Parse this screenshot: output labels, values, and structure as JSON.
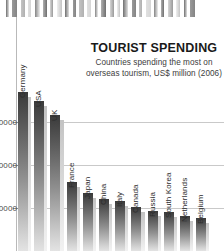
{
  "chart_data": {
    "type": "bar",
    "title": "TOURIST SPENDING",
    "subtitle_line1": "Countries spending the most on",
    "subtitle_line2": "overseas tourism, US$ million (2006)",
    "xlabel": "",
    "ylabel": "US$ million",
    "ylim": [
      0,
      80000
    ],
    "grid": true,
    "legend": "none",
    "yticks": [
      60000,
      40000,
      20000
    ],
    "ytick_labels": [
      "60000",
      "40000",
      "20000"
    ],
    "categories": [
      "Germany",
      "USA",
      "UK",
      "France",
      "Japan",
      "China",
      "Italy",
      "Canada",
      "Russia",
      "South Korea",
      "Netherlands",
      "Belgium"
    ],
    "values": [
      73900,
      69900,
      63100,
      32200,
      26900,
      24300,
      23100,
      20500,
      18800,
      18200,
      16200,
      15400
    ],
    "colors": {
      "bar_top": "#3a3a3a",
      "bar_bottom": "#e3e3e3",
      "shadow": "#d2d2d2",
      "gridline": "#c9c9c9",
      "axis": "#b9b9b9",
      "title": "#1a1a1a",
      "subtitle": "#3d3d3d",
      "background": "#ffffff"
    }
  },
  "decor": {
    "name": "top-bar-strip",
    "tick_count": 26
  }
}
